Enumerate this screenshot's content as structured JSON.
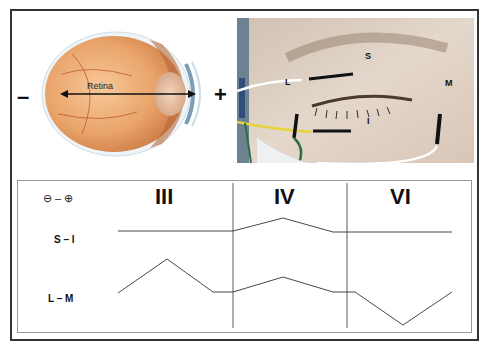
{
  "top_left": {
    "minus_sign": "–",
    "plus_sign": "+",
    "retina_label": "Retina"
  },
  "top_right": {
    "electrode_labels": {
      "superior": "S",
      "inferior": "I",
      "lateral": "L",
      "medial": "M"
    }
  },
  "bottom": {
    "polarity_legend": {
      "negative": "⊖",
      "dash": "–",
      "positive": "⊕"
    },
    "row_labels": [
      "S – I",
      "L – M"
    ],
    "column_headers": [
      "III",
      "IV",
      "VI"
    ]
  },
  "chart_data": {
    "type": "line",
    "title": "",
    "columns": [
      "III",
      "IV",
      "VI"
    ],
    "series": [
      {
        "name": "S – I",
        "points_px": [
          [
            118,
            231
          ],
          [
            233,
            231
          ],
          [
            283,
            218
          ],
          [
            333,
            232
          ],
          [
            452,
            232
          ]
        ],
        "description": "flat in III, upward deflection in IV, flat in VI"
      },
      {
        "name": "L – M",
        "points_px": [
          [
            118,
            293
          ],
          [
            167,
            259
          ],
          [
            213,
            292
          ],
          [
            233,
            292
          ],
          [
            283,
            277
          ],
          [
            333,
            292
          ],
          [
            355,
            292
          ],
          [
            403,
            325
          ],
          [
            452,
            292
          ]
        ],
        "description": "large upward peak in III, smaller upward peak in IV, downward trough in VI"
      }
    ],
    "dividers_x": [
      233,
      347
    ],
    "grid": false,
    "legend_position": "none"
  }
}
